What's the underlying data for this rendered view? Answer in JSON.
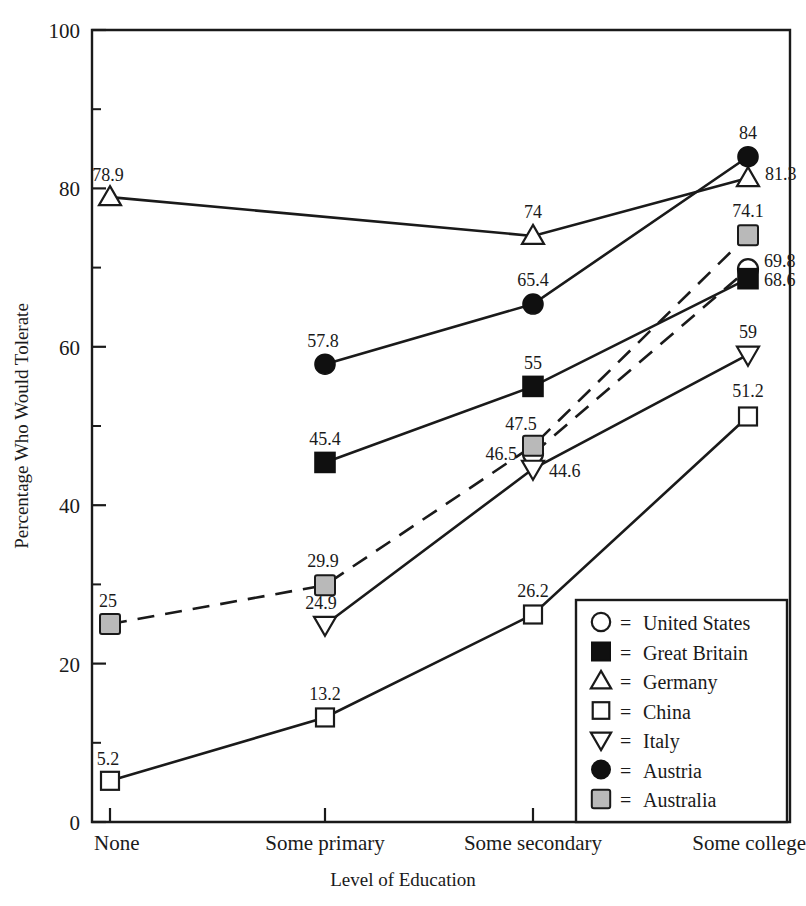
{
  "chart_data": {
    "type": "line",
    "title": "",
    "xlabel": "Level of Education",
    "ylabel": "Percentage Who Would Tolerate",
    "categories": [
      "None",
      "Some primary",
      "Some secondary",
      "Some college"
    ],
    "ylim": [
      0,
      100
    ],
    "ytick_labels": [
      "0",
      "20",
      "40",
      "60",
      "80",
      "100"
    ],
    "ytick_values": [
      0,
      20,
      40,
      60,
      80,
      100
    ],
    "yminor_values": [
      10,
      30,
      50,
      70,
      90
    ],
    "grid": false,
    "legend_position": "inside-bottom-right",
    "series": [
      {
        "name": "United States",
        "marker": "circle-open",
        "linestyle": "dashed",
        "x": [
          "Some secondary",
          "Some college"
        ],
        "values": [
          46.5,
          69.8
        ],
        "labels": [
          "46.5",
          "69.8"
        ]
      },
      {
        "name": "Great Britain",
        "marker": "square-filled",
        "linestyle": "solid",
        "x": [
          "Some primary",
          "Some secondary",
          "Some college"
        ],
        "values": [
          45.4,
          55,
          68.6
        ],
        "labels": [
          "45.4",
          "55",
          "68.6"
        ]
      },
      {
        "name": "Germany",
        "marker": "triangle-up-open",
        "linestyle": "solid",
        "x": [
          "None",
          "Some secondary",
          "Some college"
        ],
        "values": [
          78.9,
          74,
          81.3
        ],
        "labels": [
          "78.9",
          "74",
          "81.3"
        ]
      },
      {
        "name": "China",
        "marker": "square-open",
        "linestyle": "solid",
        "x": [
          "None",
          "Some primary",
          "Some secondary",
          "Some college"
        ],
        "values": [
          5.2,
          13.2,
          26.2,
          51.2
        ],
        "labels": [
          "5.2",
          "13.2",
          "26.2",
          "51.2"
        ]
      },
      {
        "name": "Italy",
        "marker": "triangle-down-open",
        "linestyle": "solid",
        "x": [
          "Some primary",
          "Some secondary",
          "Some college"
        ],
        "values": [
          24.9,
          44.6,
          59
        ],
        "labels": [
          "24.9",
          "44.6",
          "59"
        ]
      },
      {
        "name": "Austria",
        "marker": "circle-filled",
        "linestyle": "solid",
        "x": [
          "Some primary",
          "Some secondary",
          "Some college"
        ],
        "values": [
          57.8,
          65.4,
          84
        ],
        "labels": [
          "57.8",
          "65.4",
          "84"
        ]
      },
      {
        "name": "Australia",
        "marker": "square-gray",
        "linestyle": "dashed",
        "x": [
          "None",
          "Some primary",
          "Some secondary",
          "Some college"
        ],
        "values": [
          25,
          29.9,
          47.5,
          74.1
        ],
        "labels": [
          "25",
          "29.9",
          "47.5",
          "74.1"
        ]
      }
    ]
  },
  "legend": {
    "equals": "=",
    "entries": [
      {
        "marker": "circle-open",
        "label": "United States"
      },
      {
        "marker": "square-filled",
        "label": "Great Britain"
      },
      {
        "marker": "triangle-up-open",
        "label": "Germany"
      },
      {
        "marker": "square-open",
        "label": "China"
      },
      {
        "marker": "triangle-down-open",
        "label": "Italy"
      },
      {
        "marker": "circle-filled",
        "label": "Austria"
      },
      {
        "marker": "square-gray",
        "label": "Australia"
      }
    ]
  },
  "colors": {
    "ink": "#1a1a1a",
    "fill_gray": "#b9b9b9",
    "fill_black": "#101010",
    "background": "#ffffff"
  }
}
